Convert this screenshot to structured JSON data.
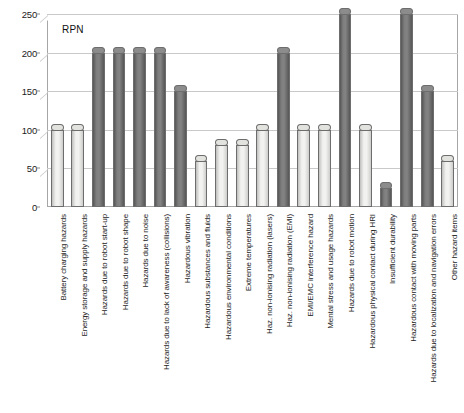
{
  "chart_data": {
    "type": "bar",
    "title": "",
    "legend_label": "RPN",
    "legend_position": "inside-top-left",
    "xlabel": "",
    "ylabel": "",
    "ylim": [
      0,
      250
    ],
    "yticks": [
      0,
      50,
      100,
      150,
      200,
      250
    ],
    "grid": true,
    "categories": [
      "Battery charging hazards",
      "Energy storage and supply hazards",
      "Hazards due to robot start-up",
      "Hazards due to robot shape",
      "Hazards due to noise",
      "Hazards due to lack of awareness (collisions)",
      "Hazardous vibration",
      "Hazardous substances and fluids",
      "Hazardous environmental conditions",
      "Extreme temperatures",
      "Haz. non-ionising radiation (lasers)",
      "Haz. non-ionising radiation (EMI)",
      "EMI/EMC interference hazard",
      "Mental stress and usage hazards",
      "Hazards due to robot motion",
      "Hazardous physical contact during HRI",
      "Insufficient durability",
      "Hazardous contact with moving parts",
      "Hazards due to localization and navigation errors",
      "Other hazard items"
    ],
    "values": [
      100,
      100,
      200,
      200,
      200,
      200,
      150,
      60,
      80,
      80,
      100,
      200,
      100,
      100,
      250,
      100,
      25,
      250,
      150,
      60
    ],
    "bar_styles": [
      "light",
      "light",
      "dark",
      "dark",
      "dark",
      "dark",
      "dark",
      "light",
      "light",
      "light",
      "light",
      "dark",
      "light",
      "light",
      "dark",
      "light",
      "dark",
      "dark",
      "dark",
      "light"
    ],
    "colors": {
      "light_bar": "#f2f2f0",
      "dark_bar": "#6f6f6f",
      "gridline": "#c9c9c9",
      "axis": "#a6a6a6",
      "text": "#1d1d1d"
    }
  }
}
